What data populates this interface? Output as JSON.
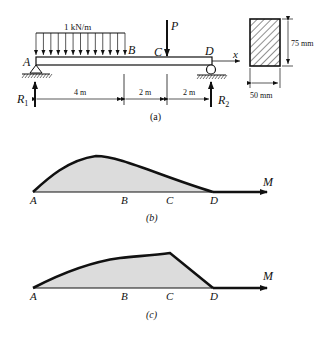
{
  "figure_a": {
    "caption": "(a)",
    "load_label": "1 kN/m",
    "point_load_label": "P",
    "points": {
      "A": "A",
      "B": "B",
      "C": "C",
      "D": "D"
    },
    "axis_label": "x",
    "reactions": {
      "R1": "R",
      "R1_sub": "1",
      "R2": "R",
      "R2_sub": "2"
    },
    "spans": [
      "4 m",
      "2 m",
      "2 m"
    ],
    "section": {
      "height_label": "75 mm",
      "width_label": "50 mm"
    }
  },
  "figure_b": {
    "caption": "(b)",
    "axis_label": "M",
    "points": [
      "A",
      "B",
      "C",
      "D"
    ]
  },
  "figure_c": {
    "caption": "(c)",
    "axis_label": "M",
    "points": [
      "A",
      "B",
      "C",
      "D"
    ]
  }
}
